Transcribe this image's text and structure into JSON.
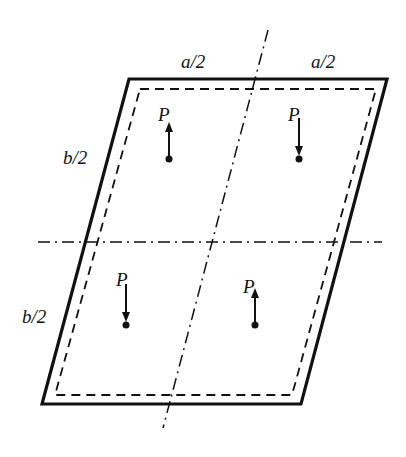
{
  "diagram": {
    "type": "skew plate with point loads",
    "dimension_labels": {
      "top_left": "a/2",
      "top_right": "a/2",
      "left_upper": "b/2",
      "left_lower": "b/2"
    },
    "loads": [
      {
        "label": "P",
        "direction": "up",
        "quadrant": "top-left"
      },
      {
        "label": "P",
        "direction": "down",
        "quadrant": "top-right"
      },
      {
        "label": "P",
        "direction": "down",
        "quadrant": "bottom-left"
      },
      {
        "label": "P",
        "direction": "up",
        "quadrant": "bottom-right"
      }
    ],
    "colors": {
      "stroke": "#111111",
      "background": "#ffffff"
    }
  }
}
